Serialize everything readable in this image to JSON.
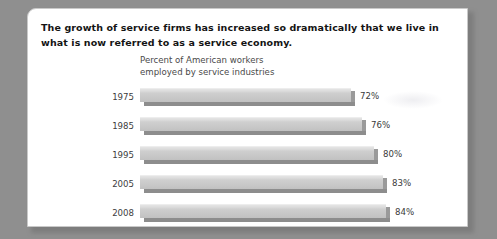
{
  "headline": "The growth of service firms has increased so dramatically that we live in what is now referred to as a service economy.",
  "chart_data": {
    "type": "bar",
    "orientation": "horizontal",
    "title": "Percent of American workers\nemployed by service industries",
    "xlabel": "",
    "ylabel": "",
    "categories": [
      "1975",
      "1985",
      "1995",
      "2005",
      "2008"
    ],
    "values": [
      72,
      76,
      80,
      83,
      84
    ],
    "value_labels": [
      "72%",
      "76%",
      "80%",
      "83%",
      "84%"
    ],
    "unit": "%",
    "xlim": [
      0,
      100
    ],
    "grid": false,
    "legend": false,
    "colors": {
      "bar_face": "#c6c6c6",
      "bar_highlight": "#e4e4e4",
      "bar_shadow": "#8d8d8d",
      "text": "#3d3d3d",
      "page_background": "#8f8f8f",
      "card_background": "#ffffff"
    }
  }
}
